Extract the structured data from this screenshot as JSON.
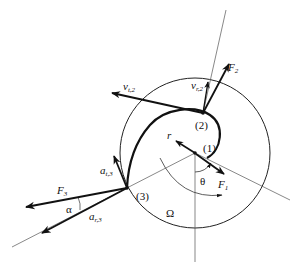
{
  "diagram": {
    "title": "",
    "points": [
      {
        "id": "p1",
        "label": "(1)"
      },
      {
        "id": "p2",
        "label": "(2)"
      },
      {
        "id": "p3",
        "label": "(3)"
      }
    ],
    "labels": {
      "F1": {
        "main": "F",
        "sub": "1"
      },
      "F2": {
        "main": "F",
        "sub": "2"
      },
      "F3": {
        "main": "F",
        "sub": "3"
      },
      "vt2": {
        "main": "v",
        "sub": "t,2"
      },
      "vr2": {
        "main": "v",
        "sub": "r,2"
      },
      "at3": {
        "main": "a",
        "sub": "t,3"
      },
      "ar3": {
        "main": "a",
        "sub": "r,3"
      },
      "r": "r",
      "theta": "θ",
      "alpha": "α",
      "omega": "Ω"
    },
    "colors": {
      "stroke": "#111111",
      "thin": "#444444",
      "background": "#ffffff"
    }
  }
}
